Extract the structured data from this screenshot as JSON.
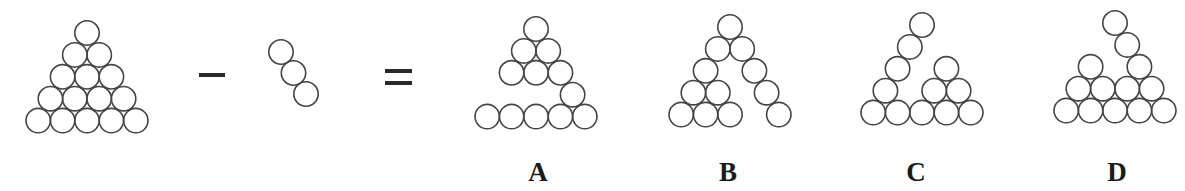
{
  "puzzle": {
    "description": "Triangle of 15 circles minus a diagonal of 3 circles equals which figure?",
    "circle_radius": 12.2,
    "grid_dx": 24.4,
    "grid_dy": 21.9,
    "stroke_color": "#444444",
    "operators": {
      "minus": "−",
      "equals": "="
    }
  },
  "figures": [
    {
      "id": "full-triangle",
      "apex": [
        87,
        33
      ],
      "cells": [
        [
          0,
          0
        ],
        [
          1,
          0
        ],
        [
          1,
          1
        ],
        [
          2,
          0
        ],
        [
          2,
          1
        ],
        [
          2,
          2
        ],
        [
          3,
          0
        ],
        [
          3,
          1
        ],
        [
          3,
          2
        ],
        [
          3,
          3
        ],
        [
          4,
          0
        ],
        [
          4,
          1
        ],
        [
          4,
          2
        ],
        [
          4,
          3
        ],
        [
          4,
          4
        ]
      ],
      "label": ""
    },
    {
      "id": "removed-piece",
      "apex": [
        281,
        52
      ],
      "cells": [
        [
          0,
          0
        ],
        [
          1,
          1
        ],
        [
          2,
          2
        ]
      ],
      "label": ""
    },
    {
      "id": "option-a",
      "apex": [
        536,
        29
      ],
      "cells": [
        [
          0,
          0
        ],
        [
          1,
          0
        ],
        [
          1,
          1
        ],
        [
          2,
          0
        ],
        [
          2,
          1
        ],
        [
          2,
          2
        ],
        [
          3,
          3
        ],
        [
          4,
          0
        ],
        [
          4,
          1
        ],
        [
          4,
          2
        ],
        [
          4,
          3
        ],
        [
          4,
          4
        ]
      ],
      "label": "A"
    },
    {
      "id": "option-b",
      "apex": [
        730,
        27
      ],
      "cells": [
        [
          0,
          0
        ],
        [
          1,
          0
        ],
        [
          1,
          1
        ],
        [
          2,
          0
        ],
        [
          2,
          2
        ],
        [
          3,
          0
        ],
        [
          3,
          1
        ],
        [
          3,
          3
        ],
        [
          4,
          0
        ],
        [
          4,
          1
        ],
        [
          4,
          2
        ],
        [
          4,
          4
        ]
      ],
      "label": "B"
    },
    {
      "id": "option-c",
      "apex": [
        922,
        25
      ],
      "cells": [
        [
          0,
          0
        ],
        [
          1,
          0
        ],
        [
          2,
          0
        ],
        [
          3,
          0
        ],
        [
          2,
          2
        ],
        [
          3,
          2
        ],
        [
          3,
          3
        ],
        [
          4,
          0
        ],
        [
          4,
          1
        ],
        [
          4,
          2
        ],
        [
          4,
          3
        ],
        [
          4,
          4
        ]
      ],
      "label": "C"
    },
    {
      "id": "option-d",
      "apex": [
        1115,
        23
      ],
      "cells": [
        [
          0,
          0
        ],
        [
          1,
          1
        ],
        [
          2,
          0
        ],
        [
          2,
          2
        ],
        [
          3,
          0
        ],
        [
          3,
          1
        ],
        [
          3,
          2
        ],
        [
          3,
          3
        ],
        [
          4,
          0
        ],
        [
          4,
          1
        ],
        [
          4,
          2
        ],
        [
          4,
          3
        ],
        [
          4,
          4
        ]
      ],
      "label": "D"
    }
  ],
  "labels": {
    "a": "A",
    "b": "B",
    "c": "C",
    "d": "D"
  }
}
